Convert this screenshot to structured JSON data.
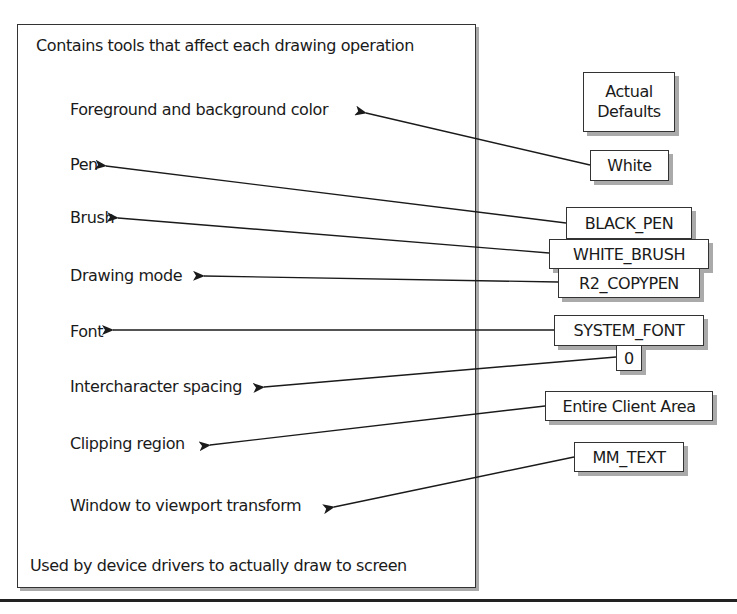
{
  "main_box": {
    "header": "Contains tools that affect each drawing operation",
    "footer": "Used by device drivers to actually draw to screen",
    "attributes": [
      {
        "label": "Foreground and background color",
        "default": "White"
      },
      {
        "label": "Pen",
        "default": "BLACK_PEN"
      },
      {
        "label": "Brush",
        "default": "WHITE_BRUSH"
      },
      {
        "label": "Drawing mode",
        "default": "R2_COPYPEN"
      },
      {
        "label": "Font",
        "default": "SYSTEM_FONT"
      },
      {
        "label": "Intercharacter spacing",
        "default": "0"
      },
      {
        "label": "Clipping region",
        "default": "Entire Client Area"
      },
      {
        "label": "Window to viewport transform",
        "default": "MM_TEXT"
      }
    ]
  },
  "defaults_header": {
    "line1": "Actual",
    "line2": "Defaults"
  }
}
